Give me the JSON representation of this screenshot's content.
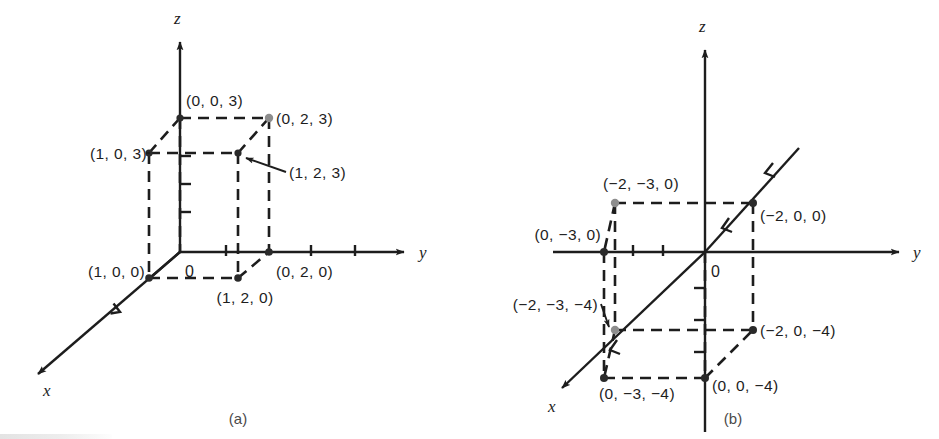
{
  "figure": {
    "type": "math-diagram",
    "panels": [
      {
        "id": "a",
        "caption": "(a)",
        "axes": {
          "x_label": "x",
          "y_label": "y",
          "z_label": "z",
          "origin_label": "0"
        },
        "vertices": [
          {
            "label": "(0, 0, 3)",
            "marker": "dot"
          },
          {
            "label": "(0, 2, 3)",
            "marker": "dot-grey"
          },
          {
            "label": "(1, 0, 3)",
            "marker": "dot"
          },
          {
            "label": "(1, 2, 3)",
            "marker": "dot"
          },
          {
            "label": "(1, 0, 0)",
            "marker": "dot"
          },
          {
            "label": "(0, 2, 0)",
            "marker": "dot"
          },
          {
            "label": "(1, 2, 0)",
            "marker": "dot"
          }
        ]
      },
      {
        "id": "b",
        "caption": "(b)",
        "axes": {
          "x_label": "x",
          "y_label": "y",
          "z_label": "z",
          "origin_label": "0"
        },
        "vertices": [
          {
            "label": "(−2, −3, 0)",
            "marker": "dot-grey"
          },
          {
            "label": "(−2, 0, 0)",
            "marker": "dot"
          },
          {
            "label": "(0, −3, 0)",
            "marker": "dot"
          },
          {
            "label": "(−2, −3, −4)",
            "marker": "dot-grey"
          },
          {
            "label": "(−2, 0, −4)",
            "marker": "dot"
          },
          {
            "label": "(0, −3, −4)",
            "marker": "dot"
          },
          {
            "label": "(0, 0, −4)",
            "marker": "dot"
          }
        ]
      }
    ],
    "colors": {
      "ink": "#1d1d1d",
      "grey_marker": "#8d8d8d",
      "background": "#ffffff"
    }
  }
}
